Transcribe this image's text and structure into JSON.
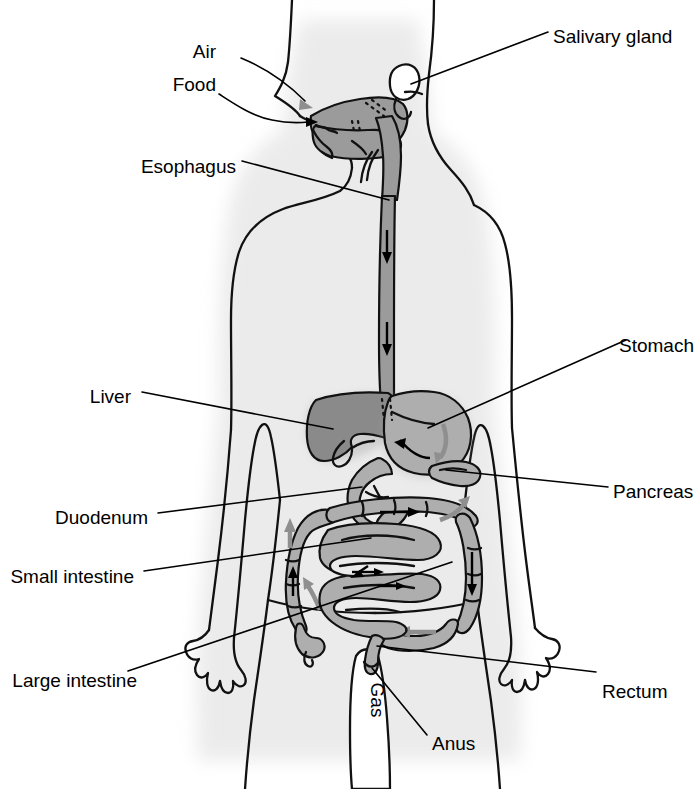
{
  "diagram": {
    "colors": {
      "background": "#ffffff",
      "outline": "#111111",
      "shadow": "#e6e6e6",
      "organ_dark": "#8c8c8c",
      "organ_mid": "#9e9e9e",
      "organ_light": "#b4b4b4",
      "arrow_gray": "#8f8f8f",
      "arrow_black": "#000000",
      "label_text": "#000000"
    },
    "labels": [
      {
        "id": "air",
        "text": "Air",
        "side": "left",
        "x": 216,
        "y": 52,
        "arrow": "gray"
      },
      {
        "id": "food",
        "text": "Food",
        "side": "left",
        "x": 216,
        "y": 85,
        "arrow": "black"
      },
      {
        "id": "esophagus",
        "text": "Esophagus",
        "side": "left",
        "x": 236,
        "y": 167
      },
      {
        "id": "liver",
        "text": "Liver",
        "side": "left",
        "x": 131,
        "y": 397
      },
      {
        "id": "duodenum",
        "text": "Duodenum",
        "side": "left",
        "x": 148,
        "y": 518
      },
      {
        "id": "small-intestine",
        "text": "Small intestine",
        "side": "left",
        "x": 134,
        "y": 577
      },
      {
        "id": "large-intestine",
        "text": "Large intestine",
        "side": "left",
        "x": 137,
        "y": 681
      },
      {
        "id": "salivary-gland",
        "text": "Salivary gland",
        "side": "right",
        "x": 553,
        "y": 37
      },
      {
        "id": "stomach",
        "text": "Stomach",
        "side": "right",
        "x": 619,
        "y": 346
      },
      {
        "id": "pancreas",
        "text": "Pancreas",
        "side": "right",
        "x": 613,
        "y": 492
      },
      {
        "id": "rectum",
        "text": "Rectum",
        "side": "right",
        "x": 602,
        "y": 692
      },
      {
        "id": "anus",
        "text": "Anus",
        "side": "right",
        "x": 432,
        "y": 744
      },
      {
        "id": "gas",
        "text": "Gas",
        "side": "center",
        "x": 371,
        "y": 700,
        "rotated": true
      }
    ],
    "organ_names": [
      "mouth-and-tongue",
      "salivary-gland",
      "pharynx",
      "esophagus",
      "stomach",
      "liver",
      "pancreas",
      "duodenum",
      "small-intestine",
      "large-intestine",
      "rectum",
      "anus"
    ],
    "flow_arrows": {
      "air_color": "#8f8f8f",
      "food_color": "#000000",
      "esophagus_arrows": 2,
      "description": "Arrows trace the path of food through the digestive tract"
    }
  }
}
